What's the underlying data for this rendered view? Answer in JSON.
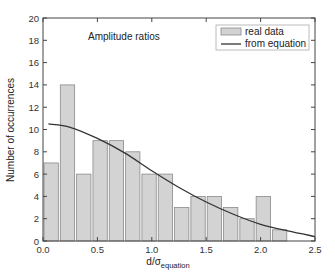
{
  "chart_data": {
    "type": "bar",
    "title": "",
    "annotation": "Amplitude ratios",
    "xlabel": "d/σ",
    "xlabel_subscript": "equation",
    "ylabel": "Number of occurrences",
    "xlim": [
      0.0,
      2.5
    ],
    "ylim": [
      0,
      20
    ],
    "xticks": [
      "0.0",
      "0.5",
      "1.0",
      "1.5",
      "2.0",
      "2.5"
    ],
    "yticks": [
      "0",
      "2",
      "4",
      "6",
      "8",
      "10",
      "12",
      "14",
      "16",
      "18",
      "20"
    ],
    "grid": false,
    "legend_position": "upper right",
    "bin_width": 0.15,
    "series": [
      {
        "name": "real data",
        "type": "bar",
        "color": "#d3d3d3",
        "edge_color": "#8a8a8a",
        "x": [
          0.075,
          0.225,
          0.375,
          0.525,
          0.675,
          0.825,
          0.975,
          1.125,
          1.275,
          1.425,
          1.575,
          1.725,
          1.875,
          2.025,
          2.175
        ],
        "values": [
          7,
          14,
          6,
          9,
          9,
          8,
          6,
          6,
          3,
          4,
          4,
          3,
          2,
          4,
          1
        ]
      },
      {
        "name": "from equation",
        "type": "line",
        "color": "#333333",
        "x": [
          0.05,
          0.25,
          0.5,
          0.75,
          1.0,
          1.25,
          1.5,
          1.75,
          2.0,
          2.25,
          2.5
        ],
        "values": [
          10.5,
          10.2,
          9.2,
          7.9,
          6.3,
          4.8,
          3.5,
          2.4,
          1.5,
          0.9,
          0.4
        ]
      }
    ]
  }
}
